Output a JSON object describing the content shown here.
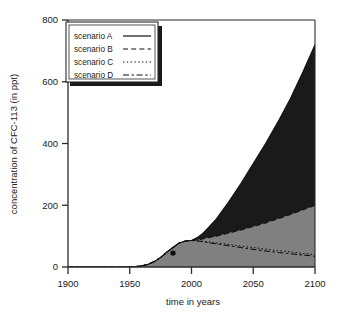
{
  "chart_data": {
    "type": "line",
    "title": "",
    "xlabel": "time in years",
    "ylabel": "concentration of  CFC-113 (in ppt)",
    "xlim": [
      1900,
      2100
    ],
    "ylim": [
      0,
      800
    ],
    "xticks": [
      1900,
      1950,
      2000,
      2050,
      2100
    ],
    "yticks": [
      0,
      200,
      400,
      600,
      800
    ],
    "grid": false,
    "legend_position": "upper-left",
    "x": [
      1900,
      1910,
      1920,
      1930,
      1940,
      1950,
      1955,
      1960,
      1965,
      1970,
      1975,
      1980,
      1985,
      1990,
      1995,
      2000,
      2005,
      2010,
      2020,
      2030,
      2040,
      2050,
      2060,
      2070,
      2080,
      2090,
      2100
    ],
    "series": [
      {
        "name": "scenario A",
        "style": "solid",
        "fill": "#1a1a1a",
        "values": [
          0,
          0,
          0,
          0,
          0,
          0.5,
          1.5,
          4,
          9,
          18,
          31,
          48,
          63,
          78,
          84,
          86,
          96,
          112,
          155,
          210,
          270,
          335,
          400,
          470,
          545,
          630,
          720
        ]
      },
      {
        "name": "scenario B",
        "style": "dashed",
        "fill": "#808080",
        "values": [
          0,
          0,
          0,
          0,
          0,
          0.5,
          1.5,
          4,
          9,
          18,
          31,
          48,
          63,
          78,
          84,
          86,
          88,
          92,
          100,
          110,
          120,
          131,
          143,
          156,
          170,
          185,
          200
        ]
      },
      {
        "name": "scenario C",
        "style": "dotted",
        "fill": "none",
        "values": [
          0,
          0,
          0,
          0,
          0,
          0.5,
          1.5,
          4,
          9,
          18,
          31,
          48,
          63,
          78,
          84,
          86,
          85,
          83,
          78,
          73,
          68,
          63,
          58,
          53,
          49,
          44,
          40
        ]
      },
      {
        "name": "scenario D",
        "style": "dashdot",
        "fill": "none",
        "values": [
          0,
          0,
          0,
          0,
          0,
          0.5,
          1.5,
          4,
          9,
          18,
          31,
          48,
          63,
          78,
          84,
          86,
          84,
          81,
          75,
          69,
          63,
          57,
          52,
          47,
          43,
          39,
          35
        ]
      }
    ],
    "marker_points": [
      {
        "x": 1985,
        "y": 45,
        "label": ""
      }
    ],
    "colors": {
      "scenario_a_fill": "#1a1a1a",
      "scenario_b_fill": "#808080",
      "axis": "#2b2b2b",
      "background": "#ffffff"
    }
  },
  "legend": {
    "entries": [
      {
        "label": "scenario A",
        "style": "solid"
      },
      {
        "label": "scenario B",
        "style": "dashed"
      },
      {
        "label": "scenario C",
        "style": "dotted"
      },
      {
        "label": "scenario D",
        "style": "dashdot"
      }
    ]
  },
  "axes": {
    "x_label": "time in years",
    "y_label": "concentration of  CFC-113 (in ppt)",
    "x_tick_labels": [
      "1900",
      "1950",
      "2000",
      "2050",
      "2100"
    ],
    "y_tick_labels": [
      "0",
      "200",
      "400",
      "600",
      "800"
    ]
  }
}
